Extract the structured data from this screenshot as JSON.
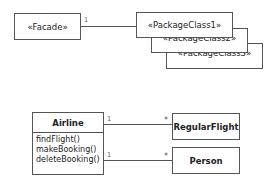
{
  "facade_diagram": {
    "facade": {
      "label": "«Facade»"
    },
    "packages": [
      {
        "label": "«PackageClass1»"
      },
      {
        "label": "«PackageClass2»"
      },
      {
        "label": "«PackageClass3»"
      }
    ],
    "association": {
      "source_multiplicity": "1"
    }
  },
  "airline_diagram": {
    "airline": {
      "name": "Airline",
      "operations": [
        "findFlight()",
        "makeBooking()",
        "deleteBooking()"
      ]
    },
    "regular_flight": {
      "name": "RegularFlight"
    },
    "person": {
      "name": "Person"
    },
    "associations": [
      {
        "source": "1",
        "target": "*"
      },
      {
        "source": "1",
        "target": "*"
      }
    ]
  }
}
